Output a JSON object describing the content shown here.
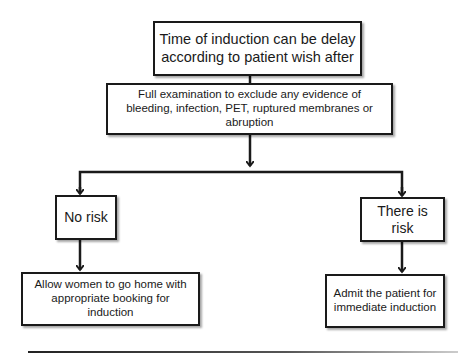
{
  "diagram": {
    "type": "flowchart",
    "nodes": {
      "start": {
        "text": "Time of induction can be delay according to patient wish after"
      },
      "exam": {
        "text": "Full examination to exclude any evidence of bleeding, infection, PET, ruptured membranes or abruption"
      },
      "no_risk": {
        "text": "No risk"
      },
      "risk": {
        "text": "There is risk"
      },
      "home": {
        "text": "Allow women to go home with appropriate booking for induction"
      },
      "admit": {
        "text": "Admit the patient for immediate induction"
      }
    },
    "edges": [
      {
        "from": "start",
        "to": "exam"
      },
      {
        "from": "exam",
        "to": "no_risk"
      },
      {
        "from": "exam",
        "to": "risk"
      },
      {
        "from": "no_risk",
        "to": "home"
      },
      {
        "from": "risk",
        "to": "admit"
      }
    ],
    "colors": {
      "stroke": "#1a1a1a",
      "fill": "#ffffff"
    }
  }
}
